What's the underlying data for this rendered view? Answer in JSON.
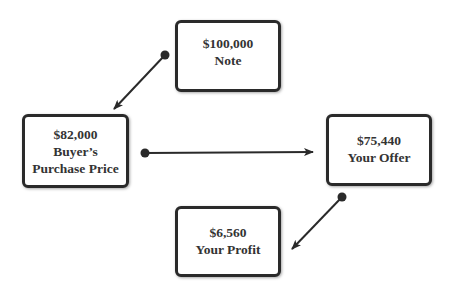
{
  "diagram": {
    "nodes": {
      "note": {
        "amount": "$100,000",
        "label": "Note"
      },
      "purchase_price": {
        "amount": "$82,000",
        "label_line1": "Buyer’s",
        "label_line2": "Purchase Price"
      },
      "offer": {
        "amount": "$75,440",
        "label": "Your Offer"
      },
      "profit": {
        "amount": "$6,560",
        "label": "Your Profit"
      }
    },
    "edges": [
      {
        "from": "note",
        "to": "purchase_price"
      },
      {
        "from": "purchase_price",
        "to": "offer"
      },
      {
        "from": "offer",
        "to": "profit"
      }
    ],
    "colors": {
      "border": "#2a2a2a",
      "text": "#333333",
      "arrow": "#2a2a2a",
      "background": "#ffffff"
    }
  }
}
